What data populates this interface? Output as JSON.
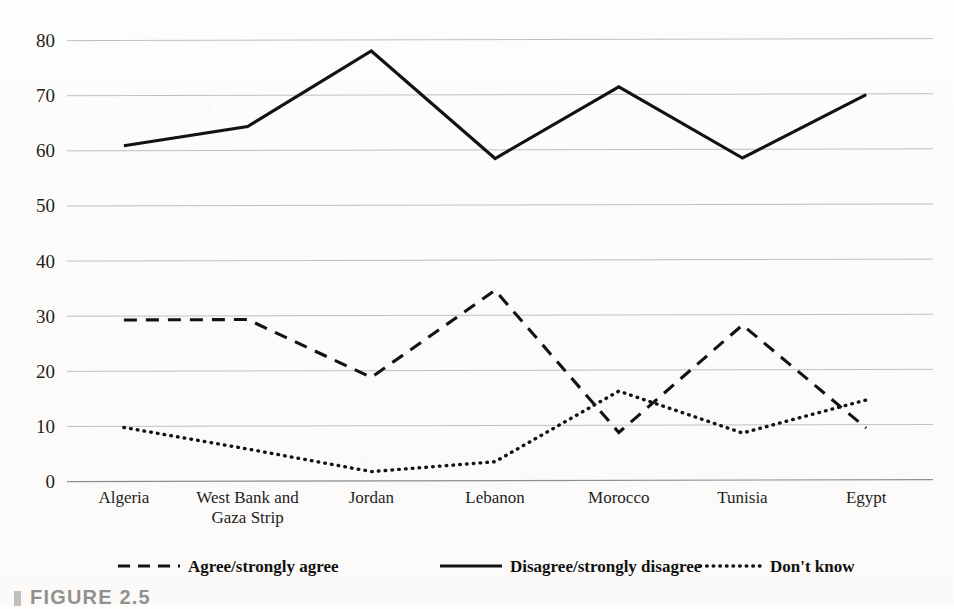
{
  "chart_data": {
    "type": "line",
    "title": "",
    "xlabel": "",
    "ylabel": "",
    "ylim": [
      0,
      80
    ],
    "ytick_values": [
      80,
      70,
      60,
      50,
      40,
      30,
      20,
      10,
      0
    ],
    "grid": true,
    "legend_position": "bottom",
    "categories": [
      "Algeria",
      "West Bank and\nGaza Strip",
      "Jordan",
      "Lebanon",
      "Morocco",
      "Tunisia",
      "Egypt"
    ],
    "category_lines": [
      [
        "Algeria"
      ],
      [
        "West Bank and",
        "Gaza Strip"
      ],
      [
        "Jordan"
      ],
      [
        "Lebanon"
      ],
      [
        "Morocco"
      ],
      [
        "Tunisia"
      ],
      [
        "Egypt"
      ]
    ],
    "series": [
      {
        "name": "Agree/strongly agree",
        "style": "dashed",
        "color": "#121212",
        "values": [
          29.2,
          29.3,
          18.8,
          34.6,
          8.8,
          28.3,
          9.6
        ]
      },
      {
        "name": "Disagree/strongly disagree",
        "style": "solid",
        "color": "#121212",
        "values": [
          60.8,
          64.3,
          78.0,
          58.5,
          71.5,
          58.6,
          70.1
        ]
      },
      {
        "name": "Don't know",
        "style": "dotted",
        "color": "#121212",
        "values": [
          9.7,
          5.8,
          1.7,
          3.5,
          16.3,
          8.7,
          14.7
        ]
      }
    ]
  },
  "legend": {
    "items": [
      {
        "label": "Agree/strongly agree",
        "style": "dashed"
      },
      {
        "label": "Disagree/strongly disagree",
        "style": "solid"
      },
      {
        "label": "Don't know",
        "style": "dotted"
      }
    ]
  },
  "caption": {
    "text": "FIGURE 2.5"
  }
}
